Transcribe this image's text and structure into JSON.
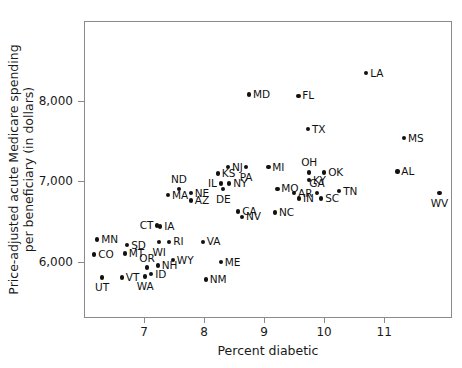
{
  "chart_data": {
    "type": "scatter",
    "title": "",
    "xlabel": "Percent diabetic",
    "ylabel": "Price-adjusted acute Medicare spending\nper beneficiary (in dollars)",
    "xlim": [
      6.0,
      12.13
    ],
    "ylim": [
      5300,
      8990
    ],
    "xticks": [
      7,
      8,
      9,
      10,
      11
    ],
    "xticklabels": [
      "7",
      "8",
      "9",
      "10",
      "11"
    ],
    "yticks": [
      6000,
      7000,
      8000
    ],
    "yticklabels": [
      "6,000",
      "7,000",
      "8,000"
    ],
    "grid": false,
    "legend": null,
    "marker_color": "#111111",
    "frame_color": "#8a8a8a",
    "points": [
      {
        "label": "LA",
        "x": 10.7,
        "y": 8345,
        "lab_pos": "r"
      },
      {
        "label": "MD",
        "x": 8.75,
        "y": 8075,
        "lab_pos": "r"
      },
      {
        "label": "FL",
        "x": 9.57,
        "y": 8062,
        "lab_pos": "r"
      },
      {
        "label": "TX",
        "x": 9.73,
        "y": 7645,
        "lab_pos": "r"
      },
      {
        "label": "MS",
        "x": 11.33,
        "y": 7537,
        "lab_pos": "r"
      },
      {
        "label": "AL",
        "x": 11.22,
        "y": 7121,
        "lab_pos": "r"
      },
      {
        "label": "WV",
        "x": 11.92,
        "y": 6852,
        "lab_pos": "bc"
      },
      {
        "label": "NJ",
        "x": 8.4,
        "y": 7175,
        "lab_pos": "r"
      },
      {
        "label": "PA",
        "x": 8.7,
        "y": 7175,
        "lab_pos": "bc"
      },
      {
        "label": "MI",
        "x": 9.07,
        "y": 7175,
        "lab_pos": "r"
      },
      {
        "label": "OH",
        "x": 9.75,
        "y": 7108,
        "lab_pos": "tc"
      },
      {
        "label": "OK",
        "x": 10.0,
        "y": 7108,
        "lab_pos": "r"
      },
      {
        "label": "KS",
        "x": 8.23,
        "y": 7094,
        "lab_pos": "r"
      },
      {
        "label": "KY",
        "x": 9.75,
        "y": 7013,
        "lab_pos": "r"
      },
      {
        "label": "NY",
        "x": 8.42,
        "y": 6973,
        "lab_pos": "r"
      },
      {
        "label": "IL",
        "x": 8.28,
        "y": 6973,
        "lab_pos": "l"
      },
      {
        "label": "DE",
        "x": 8.32,
        "y": 6906,
        "lab_pos": "bc"
      },
      {
        "label": "MO",
        "x": 9.22,
        "y": 6906,
        "lab_pos": "r"
      },
      {
        "label": "ND",
        "x": 7.58,
        "y": 6906,
        "lab_pos": "tc"
      },
      {
        "label": "TN",
        "x": 10.25,
        "y": 6879,
        "lab_pos": "r"
      },
      {
        "label": "AR",
        "x": 9.5,
        "y": 6852,
        "lab_pos": "r"
      },
      {
        "label": "GA",
        "x": 9.88,
        "y": 6852,
        "lab_pos": "tc"
      },
      {
        "label": "NE",
        "x": 7.78,
        "y": 6852,
        "lab_pos": "r"
      },
      {
        "label": "MA",
        "x": 7.4,
        "y": 6825,
        "lab_pos": "r"
      },
      {
        "label": "IN",
        "x": 9.58,
        "y": 6785,
        "lab_pos": "r"
      },
      {
        "label": "SC",
        "x": 9.95,
        "y": 6785,
        "lab_pos": "r"
      },
      {
        "label": "AZ",
        "x": 7.78,
        "y": 6758,
        "lab_pos": "r"
      },
      {
        "label": "CA",
        "x": 8.57,
        "y": 6624,
        "lab_pos": "r"
      },
      {
        "label": "NC",
        "x": 9.18,
        "y": 6610,
        "lab_pos": "r"
      },
      {
        "label": "NV",
        "x": 8.63,
        "y": 6557,
        "lab_pos": "r"
      },
      {
        "label": "IA",
        "x": 7.27,
        "y": 6436,
        "lab_pos": "r"
      },
      {
        "label": "CT",
        "x": 7.22,
        "y": 6449,
        "lab_pos": "l"
      },
      {
        "label": "MN",
        "x": 6.22,
        "y": 6275,
        "lab_pos": "r"
      },
      {
        "label": "RI",
        "x": 7.42,
        "y": 6248,
        "lab_pos": "r"
      },
      {
        "label": "VA",
        "x": 7.98,
        "y": 6248,
        "lab_pos": "r"
      },
      {
        "label": "WI",
        "x": 7.25,
        "y": 6248,
        "lab_pos": "bc"
      },
      {
        "label": "SD",
        "x": 6.72,
        "y": 6208,
        "lab_pos": "r"
      },
      {
        "label": "CO",
        "x": 6.17,
        "y": 6087,
        "lab_pos": "r"
      },
      {
        "label": "MT",
        "x": 6.68,
        "y": 6100,
        "lab_pos": "r"
      },
      {
        "label": "WY",
        "x": 7.48,
        "y": 6020,
        "lab_pos": "r"
      },
      {
        "label": "ME",
        "x": 8.28,
        "y": 5993,
        "lab_pos": "r"
      },
      {
        "label": "NH",
        "x": 7.23,
        "y": 5953,
        "lab_pos": "r"
      },
      {
        "label": "OR",
        "x": 7.05,
        "y": 5926,
        "lab_pos": "tc"
      },
      {
        "label": "ID",
        "x": 7.12,
        "y": 5845,
        "lab_pos": "r"
      },
      {
        "label": "WA",
        "x": 7.02,
        "y": 5818,
        "lab_pos": "bc"
      },
      {
        "label": "VT",
        "x": 6.63,
        "y": 5805,
        "lab_pos": "r"
      },
      {
        "label": "NM",
        "x": 8.03,
        "y": 5778,
        "lab_pos": "r"
      },
      {
        "label": "UT",
        "x": 6.3,
        "y": 5805,
        "lab_pos": "bc"
      }
    ]
  }
}
